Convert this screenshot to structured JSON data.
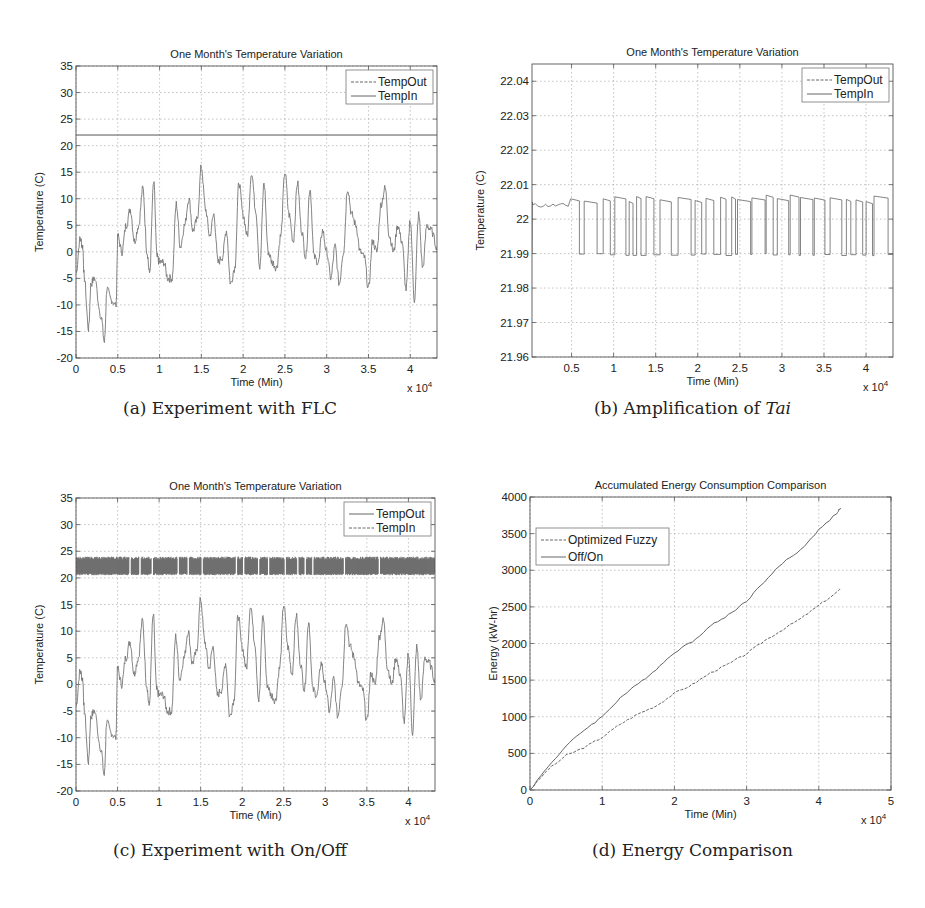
{
  "captions": {
    "a": "(a) Experiment with FLC",
    "b_prefix": "(b) Amplification of ",
    "b_italic": "Tai",
    "c": "(c) Experiment with On/Off",
    "d": "(d) Energy Comparison"
  },
  "chart_data": [
    {
      "id": "a",
      "type": "line",
      "title": "One Month's Temperature Variation",
      "xlabel": "Time (Min)",
      "ylabel": "Temperature (C)",
      "x_multiplier": "x 10^4",
      "xlim": [
        0,
        4.32
      ],
      "ylim": [
        -20,
        35
      ],
      "xticks": [
        "0",
        "0.5",
        "1",
        "1.5",
        "2",
        "2.5",
        "3",
        "3.5",
        "4"
      ],
      "yticks": [
        "-20",
        "-15",
        "-10",
        "-5",
        "0",
        "5",
        "10",
        "15",
        "20",
        "25",
        "30",
        "35"
      ],
      "grid": true,
      "legend": {
        "position": "upper right",
        "entries": [
          "TempOut",
          "TempIn"
        ]
      },
      "series": [
        {
          "name": "TempOut",
          "style": "dashed",
          "x": [
            0,
            0.05,
            0.08,
            0.1,
            0.15,
            0.18,
            0.22,
            0.3,
            0.34,
            0.37,
            0.42,
            0.48,
            0.5,
            0.55,
            0.6,
            0.65,
            0.7,
            0.75,
            0.8,
            0.85,
            0.88,
            0.93,
            0.97,
            1.0,
            1.05,
            1.1,
            1.15,
            1.2,
            1.25,
            1.3,
            1.35,
            1.4,
            1.45,
            1.5,
            1.55,
            1.6,
            1.65,
            1.7,
            1.75,
            1.8,
            1.85,
            1.9,
            1.95,
            2.0,
            2.05,
            2.1,
            2.15,
            2.2,
            2.25,
            2.3,
            2.35,
            2.4,
            2.45,
            2.5,
            2.55,
            2.6,
            2.65,
            2.7,
            2.75,
            2.8,
            2.85,
            2.9,
            2.95,
            3.0,
            3.05,
            3.1,
            3.15,
            3.2,
            3.25,
            3.3,
            3.35,
            3.4,
            3.45,
            3.5,
            3.55,
            3.6,
            3.65,
            3.7,
            3.75,
            3.8,
            3.85,
            3.9,
            3.95,
            4.0,
            4.05,
            4.1,
            4.15,
            4.2,
            4.25,
            4.32
          ],
          "y": [
            -4,
            2.5,
            1,
            -5,
            -14.5,
            -6,
            -5,
            -12,
            -17,
            -7,
            -9,
            -10,
            3,
            0,
            5,
            8,
            2,
            5,
            12,
            0,
            -4,
            13,
            -1,
            -2,
            -2,
            -5,
            -5,
            9,
            1,
            5,
            10,
            4,
            6,
            16,
            8,
            3,
            7,
            -2,
            -1,
            4,
            -6,
            -3,
            13,
            7,
            3,
            15,
            8,
            -3,
            13,
            0,
            -2,
            -3,
            3,
            15,
            7,
            2,
            13,
            4,
            -1,
            12,
            -1,
            -2,
            4,
            0,
            -5,
            1,
            -6,
            0,
            12,
            7,
            5,
            0,
            -1,
            -7,
            2,
            0,
            9,
            12,
            3,
            0,
            5,
            2,
            -7,
            6,
            -9,
            7,
            -3,
            5,
            4,
            1
          ]
        },
        {
          "name": "TempIn",
          "style": "solid",
          "constant": 22
        }
      ]
    },
    {
      "id": "b",
      "type": "line",
      "title": "One Month's Temperature Variation",
      "xlabel": "Time (Min)",
      "ylabel": "Temperature (C)",
      "x_multiplier": "x 10^4",
      "xlim": [
        0.03,
        4.32
      ],
      "ylim": [
        21.96,
        22.045
      ],
      "xticks": [
        "0.5",
        "1",
        "1.5",
        "2",
        "2.5",
        "3",
        "3.5",
        "4"
      ],
      "yticks": [
        "21.96",
        "21.97",
        "21.98",
        "21.99",
        "22",
        "22.01",
        "22.02",
        "22.03",
        "22.04"
      ],
      "grid": true,
      "legend": {
        "position": "upper right",
        "entries": [
          "TempOut",
          "TempIn"
        ]
      },
      "series": [
        {
          "name": "TempIn",
          "style": "solid",
          "description": "switching between ~21.99 and ~22.005-22.007 throughout; steady ~22.004 from 0.03 to 0.48"
        }
      ]
    },
    {
      "id": "c",
      "type": "line",
      "title": "One Month's Temperature Variation",
      "xlabel": "Time (Min)",
      "ylabel": "Temperature (C)",
      "x_multiplier": "x 10^4",
      "xlim": [
        0,
        4.32
      ],
      "ylim": [
        -20,
        35
      ],
      "xticks": [
        "0",
        "0.5",
        "1",
        "1.5",
        "2",
        "2.5",
        "3",
        "3.5",
        "4"
      ],
      "yticks": [
        "-20",
        "-15",
        "-10",
        "-5",
        "0",
        "5",
        "10",
        "15",
        "20",
        "25",
        "30",
        "35"
      ],
      "grid": true,
      "legend": {
        "position": "upper right",
        "entries": [
          "TempOut",
          "TempIn"
        ]
      },
      "series": [
        {
          "name": "TempOut",
          "style": "solid",
          "same_as": "a.TempOut"
        },
        {
          "name": "TempIn",
          "style": "dashed",
          "band": [
            20.5,
            24
          ],
          "gaps_x": [
            0.65,
            0.77,
            0.92,
            1.23,
            1.35,
            1.52,
            1.93,
            2.02,
            2.2,
            2.32,
            2.52,
            2.67,
            2.76,
            2.85,
            3.23,
            3.65
          ]
        }
      ]
    },
    {
      "id": "d",
      "type": "line",
      "title": "Accumulated Energy Consumption Comparison",
      "xlabel": "Time (Min)",
      "ylabel": "Energy (kW-hr)",
      "x_multiplier": "x 10^4",
      "xlim": [
        0,
        5
      ],
      "ylim": [
        0,
        4000
      ],
      "xticks": [
        "0",
        "1",
        "2",
        "3",
        "4",
        "5"
      ],
      "yticks": [
        "0",
        "500",
        "1000",
        "1500",
        "2000",
        "2500",
        "3000",
        "3500",
        "4000"
      ],
      "grid": true,
      "legend": {
        "position": "upper left",
        "entries": [
          "Optimized Fuzzy",
          "Off/On"
        ]
      },
      "series": [
        {
          "name": "Optimized Fuzzy",
          "style": "dashed",
          "x": [
            0,
            0.25,
            0.5,
            0.75,
            1.0,
            1.25,
            1.5,
            1.75,
            2.0,
            2.25,
            2.5,
            2.75,
            3.0,
            3.25,
            3.5,
            3.75,
            4.0,
            4.25,
            4.3
          ],
          "y": [
            0,
            280,
            470,
            580,
            720,
            900,
            1040,
            1150,
            1320,
            1440,
            1600,
            1720,
            1860,
            2040,
            2190,
            2340,
            2520,
            2700,
            2740
          ]
        },
        {
          "name": "Off/On",
          "style": "solid",
          "x": [
            0,
            0.25,
            0.5,
            0.75,
            1.0,
            1.25,
            1.5,
            1.75,
            2.0,
            2.25,
            2.5,
            2.75,
            3.0,
            3.25,
            3.5,
            3.75,
            4.0,
            4.25,
            4.3
          ],
          "y": [
            0,
            320,
            600,
            820,
            1000,
            1260,
            1450,
            1650,
            1880,
            2030,
            2240,
            2390,
            2580,
            2850,
            3100,
            3280,
            3550,
            3780,
            3850
          ]
        }
      ]
    }
  ]
}
